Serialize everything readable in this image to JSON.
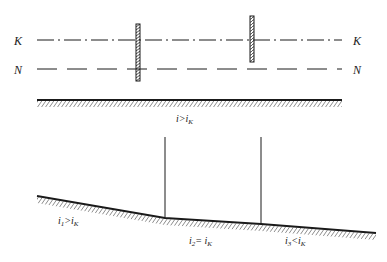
{
  "top_diagram": {
    "line_K": {
      "label_left": "K",
      "label_right": "K",
      "style": "dash-dot"
    },
    "line_N": {
      "label_left": "N",
      "label_right": "N",
      "style": "dashed"
    },
    "gates": 2,
    "bed_label": {
      "main": "i>i",
      "sub": "K"
    }
  },
  "bottom_diagram": {
    "segments": [
      {
        "label_main": "i",
        "label_sub1": "1",
        "label_rel": ">i",
        "label_sub2": "K"
      },
      {
        "label_main": "i",
        "label_sub1": "2",
        "label_rel": "= i",
        "label_sub2": "K"
      },
      {
        "label_main": "i",
        "label_sub1": "3",
        "label_rel": "<i",
        "label_sub2": "K"
      }
    ]
  },
  "colors": {
    "ink": "#1a1a1a",
    "background": "#ffffff"
  }
}
